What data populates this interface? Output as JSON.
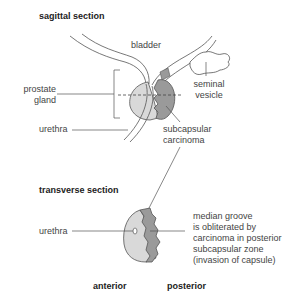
{
  "sagittal": {
    "title": "sagittal section",
    "labels": {
      "bladder": "bladder",
      "prostate_line1": "prostate",
      "prostate_line2": "gland",
      "seminal_line1": "seminal",
      "seminal_line2": "vesicle",
      "urethra": "urethra",
      "subcapsular_line1": "subcapsular",
      "subcapsular_line2": "carcinoma"
    }
  },
  "transverse": {
    "title": "transverse section",
    "labels": {
      "urethra": "urethra",
      "note_line1": "median groove",
      "note_line2": "is obliterated by",
      "note_line3": "carcinoma in posterior",
      "note_line4": "subcapsular zone",
      "note_line5": "(invasion of capsule)"
    },
    "orientation": {
      "anterior": "anterior",
      "posterior": "posterior"
    }
  },
  "colors": {
    "gland": "#d9d9d9",
    "carcinoma": "#9a9a9a",
    "outline": "#555555"
  }
}
